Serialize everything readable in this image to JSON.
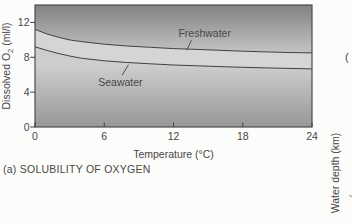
{
  "figure": {
    "caption": "(a) SOLUBILITY OF OXYGEN"
  },
  "chart_data": {
    "type": "area",
    "title": "",
    "xlabel": "Temperature (°C)",
    "ylabel": "Dissolved O2 (ml/l)",
    "ylabel_parts": {
      "prefix": "Dissolved O",
      "sub": "2",
      "suffix": " (ml/l)"
    },
    "xlim": [
      0,
      24
    ],
    "ylim": [
      0,
      14
    ],
    "x_ticks": [
      0,
      6,
      12,
      18,
      24
    ],
    "y_ticks": [
      0,
      4,
      8,
      12
    ],
    "grid": false,
    "legend_position": "inline-annotations",
    "x": [
      0,
      1,
      2,
      3,
      4,
      6,
      8,
      10,
      12,
      14,
      16,
      18,
      20,
      22,
      24
    ],
    "series": [
      {
        "name": "Freshwater",
        "values": [
          11.2,
          10.7,
          10.3,
          10.0,
          9.8,
          9.5,
          9.3,
          9.15,
          9.0,
          8.9,
          8.8,
          8.7,
          8.62,
          8.55,
          8.5
        ]
      },
      {
        "name": "Seawater",
        "values": [
          9.2,
          8.8,
          8.45,
          8.15,
          7.9,
          7.6,
          7.4,
          7.25,
          7.12,
          7.02,
          6.93,
          6.85,
          6.78,
          6.72,
          6.67
        ]
      }
    ],
    "annotations": [
      {
        "text": "Freshwater",
        "text_at": [
          14.7,
          10.35
        ],
        "leader": [
          [
            13.55,
            9.95
          ],
          [
            13.15,
            8.8
          ]
        ]
      },
      {
        "text": "Seawater",
        "text_at": [
          7.4,
          4.7
        ],
        "leader": [
          [
            7.55,
            5.95
          ],
          [
            8.1,
            7.15
          ]
        ]
      }
    ],
    "colors": {
      "paper": "#fcfcfa",
      "upper_top": "#828282",
      "upper_bottom": "#c4c4c4",
      "band": "#d5d5d5",
      "lower_top": "#cdcdcd",
      "lower_bottom": "#979797",
      "line": "#3f3f3f",
      "border": "#4c4c4c",
      "text": "#474747"
    }
  },
  "adjacent_figure": {
    "y_axis_label": "Water depth (km)",
    "text_fragment": "("
  }
}
